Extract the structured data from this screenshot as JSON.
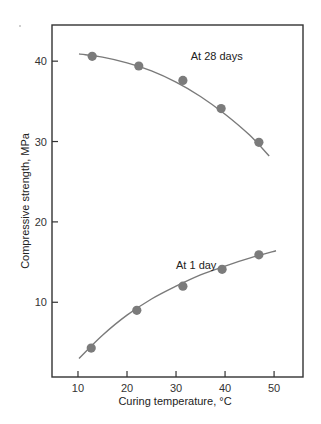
{
  "chart_data": {
    "type": "scatter",
    "title": "",
    "xlabel": "Curing temperature, °C",
    "ylabel": "Compressive strength, MPa",
    "xlim": [
      4.7,
      55.9
    ],
    "ylim": [
      0.7,
      44.5
    ],
    "x_ticks": [
      10,
      20,
      30,
      40,
      50
    ],
    "y_ticks": [
      10,
      20,
      30,
      40
    ],
    "grid": false,
    "legend": null,
    "series": [
      {
        "name": "At 28 days",
        "points": [
          {
            "x": 12.9,
            "y": 40.6
          },
          {
            "x": 22.4,
            "y": 39.4
          },
          {
            "x": 31.4,
            "y": 37.6
          },
          {
            "x": 39.2,
            "y": 34.1
          },
          {
            "x": 46.9,
            "y": 29.9
          }
        ],
        "fit_curve": [
          {
            "x": 10.2,
            "y": 40.9
          },
          {
            "x": 15,
            "y": 40.5
          },
          {
            "x": 20,
            "y": 39.8
          },
          {
            "x": 25,
            "y": 38.8
          },
          {
            "x": 30,
            "y": 37.4
          },
          {
            "x": 35,
            "y": 35.6
          },
          {
            "x": 40,
            "y": 33.4
          },
          {
            "x": 45,
            "y": 30.8
          },
          {
            "x": 49.0,
            "y": 28.2
          }
        ],
        "label_position": {
          "x": 33,
          "y": 40.1
        }
      },
      {
        "name": "At 1 day",
        "points": [
          {
            "x": 12.7,
            "y": 4.3
          },
          {
            "x": 22.0,
            "y": 9.0
          },
          {
            "x": 31.4,
            "y": 12.0
          },
          {
            "x": 39.4,
            "y": 14.1
          },
          {
            "x": 46.9,
            "y": 15.9
          }
        ],
        "fit_curve": [
          {
            "x": 10.2,
            "y": 3.0
          },
          {
            "x": 15,
            "y": 5.9
          },
          {
            "x": 20,
            "y": 8.4
          },
          {
            "x": 25,
            "y": 10.4
          },
          {
            "x": 30,
            "y": 12.0
          },
          {
            "x": 35,
            "y": 13.4
          },
          {
            "x": 40,
            "y": 14.5
          },
          {
            "x": 45,
            "y": 15.5
          },
          {
            "x": 50.4,
            "y": 16.4
          }
        ],
        "label_position": {
          "x": 30,
          "y": 14.2
        }
      }
    ],
    "annotations": [
      "At 28 days",
      "At 1 day"
    ]
  },
  "colors": {
    "axis": "#333333",
    "curve": "#7a7a7a",
    "marker": "#7b7b7b",
    "background": "#ffffff"
  }
}
